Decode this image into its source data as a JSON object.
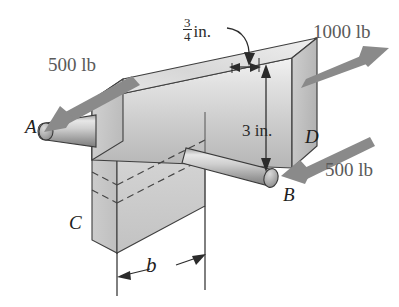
{
  "figure": {
    "background_color": "#ffffff",
    "body_color": "#c9c9c9",
    "arrow_color": "#8a8a8a",
    "line_color": "#3a3a3a",
    "dim_color": "#2b2b2b",
    "label_color": "#5a5a5a"
  },
  "loads": [
    {
      "id": "load-left",
      "value": "500 lb",
      "label": "500 lb",
      "direction": "down-left",
      "at_point": "A"
    },
    {
      "id": "load-top",
      "value": "1000 lb",
      "label": "1000 lb",
      "direction": "up-right",
      "at_point": "D"
    },
    {
      "id": "load-right",
      "value": "500 lb",
      "label": "500 lb",
      "direction": "down-left",
      "at_point": "B"
    }
  ],
  "dimensions": [
    {
      "id": "dim-thickness",
      "numerator": "3",
      "denominator": "4",
      "unit": "in.",
      "label": "3/4 in.",
      "orientation": "horizontal-leader"
    },
    {
      "id": "dim-height",
      "label": "3 in.",
      "value": "3",
      "unit": "in.",
      "orientation": "vertical"
    },
    {
      "id": "dim-b",
      "label": "b",
      "value": "b",
      "unit": "",
      "orientation": "horizontal"
    }
  ],
  "points": [
    {
      "id": "point-A",
      "label": "A",
      "desc": "left rod end"
    },
    {
      "id": "point-B",
      "label": "B",
      "desc": "right rod end"
    },
    {
      "id": "point-C",
      "label": "C",
      "desc": "lower left block corner"
    },
    {
      "id": "point-D",
      "label": "D",
      "desc": "right block face"
    }
  ]
}
